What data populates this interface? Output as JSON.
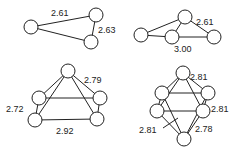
{
  "figure": {
    "clusters": [
      {
        "id": "triangle",
        "atoms": [
          [
            31,
            27
          ],
          [
            96,
            15
          ],
          [
            91,
            42
          ]
        ],
        "bonds": [
          [
            0,
            1
          ],
          [
            0,
            2
          ],
          [
            1,
            2
          ]
        ],
        "labels": [
          {
            "text": "2.61",
            "x": 51,
            "y": 16
          },
          {
            "text": "2.63",
            "x": 98,
            "y": 33
          }
        ]
      },
      {
        "id": "butterfly",
        "atoms": [
          [
            185,
            17
          ],
          [
            141,
            35
          ],
          [
            172,
            37
          ],
          [
            214,
            37
          ]
        ],
        "bonds": [
          [
            0,
            1
          ],
          [
            0,
            2
          ],
          [
            0,
            3
          ],
          [
            1,
            2
          ],
          [
            2,
            3
          ]
        ],
        "labels": [
          {
            "text": "2.61",
            "x": 196,
            "y": 25
          },
          {
            "text": "3.00",
            "x": 174,
            "y": 52
          }
        ]
      },
      {
        "id": "square-pyramid",
        "atoms": [
          [
            68,
            71
          ],
          [
            39,
            98
          ],
          [
            100,
            98
          ],
          [
            35,
            120
          ],
          [
            97,
            119
          ]
        ],
        "bonds": [
          [
            0,
            1
          ],
          [
            0,
            2
          ],
          [
            0,
            3
          ],
          [
            0,
            4
          ],
          [
            1,
            2
          ],
          [
            3,
            4
          ],
          [
            1,
            3
          ],
          [
            2,
            4
          ]
        ],
        "labels": [
          {
            "text": "2.79",
            "x": 84,
            "y": 83
          },
          {
            "text": "2.72",
            "x": 6,
            "y": 112
          },
          {
            "text": "2.92",
            "x": 56,
            "y": 134
          }
        ]
      },
      {
        "id": "octahedron",
        "atoms": [
          [
            183,
            73
          ],
          [
            162,
            93
          ],
          [
            208,
            93
          ],
          [
            157,
            111
          ],
          [
            203,
            111
          ],
          [
            184,
            139
          ]
        ],
        "bonds": [
          [
            0,
            1
          ],
          [
            0,
            2
          ],
          [
            0,
            3
          ],
          [
            0,
            4
          ],
          [
            5,
            1
          ],
          [
            5,
            2
          ],
          [
            5,
            3
          ],
          [
            5,
            4
          ],
          [
            1,
            2
          ],
          [
            3,
            4
          ],
          [
            1,
            3
          ],
          [
            2,
            4
          ]
        ],
        "labels": [
          {
            "text": "2.81",
            "x": 190,
            "y": 80
          },
          {
            "text": "2.81",
            "x": 211,
            "y": 112
          },
          {
            "text": "2.81",
            "x": 139,
            "y": 133
          },
          {
            "text": "2.78",
            "x": 195,
            "y": 132
          }
        ]
      }
    ],
    "atom_radius": 7
  }
}
